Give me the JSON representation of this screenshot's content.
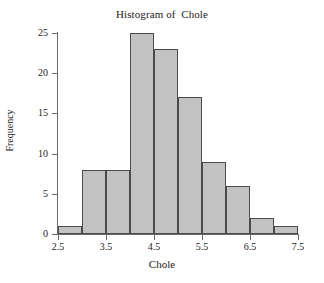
{
  "chart_data": {
    "type": "bar",
    "title": "Histogram of  Chole",
    "xlabel": "Chole",
    "ylabel": "Frequency",
    "grid": false,
    "legend": "none",
    "bin_width": 0.5,
    "xlim": [
      2.5,
      7.5
    ],
    "ylim": [
      0,
      25
    ],
    "xticks": [
      "2.5",
      "3.5",
      "4.5",
      "5.5",
      "6.5",
      "7.5"
    ],
    "xtick_values": [
      2.5,
      3.5,
      4.5,
      5.5,
      6.5,
      7.5
    ],
    "yticks": [
      "0",
      "5",
      "10",
      "15",
      "20",
      "25"
    ],
    "ytick_values": [
      0,
      5,
      10,
      15,
      20,
      25
    ],
    "bin_edges": [
      2.5,
      3.0,
      3.5,
      4.0,
      4.5,
      5.0,
      5.5,
      6.0,
      6.5,
      7.0,
      7.5
    ],
    "categories": [
      "2.5-3.0",
      "3.0-3.5",
      "3.5-4.0",
      "4.0-4.5",
      "4.5-5.0",
      "5.0-5.5",
      "5.5-6.0",
      "6.0-6.5",
      "6.5-7.0",
      "7.0-7.5"
    ],
    "values": [
      1,
      8,
      8,
      25,
      23,
      17,
      9,
      6,
      2,
      1
    ],
    "bar_fill_color": "#c2c2c2",
    "bar_edge_color": "#4a4a4a",
    "axis_color": "#6a6a6a",
    "background_color": "#ffffff"
  }
}
